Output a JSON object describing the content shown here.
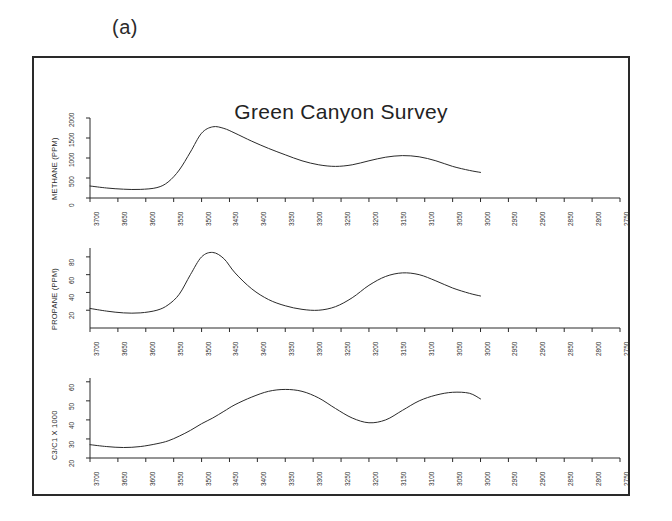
{
  "panel_label": "(a)",
  "chart_data": {
    "type": "line",
    "title": "Green Canyon Survey",
    "xlabel": "",
    "grid": false,
    "legend": "none",
    "x_axis": {
      "reversed": true,
      "range": [
        3700,
        2750
      ],
      "ticks": [
        3700,
        3650,
        3600,
        3550,
        3500,
        3450,
        3400,
        3350,
        3300,
        3250,
        3200,
        3150,
        3100,
        3050,
        3000,
        2950,
        2900,
        2850,
        2800,
        2750
      ],
      "tick_labels": [
        "3700",
        "3650",
        "3600",
        "3550",
        "3500",
        "3450",
        "3400",
        "3350",
        "3300",
        "3250",
        "3200",
        "3150",
        "3100",
        "3050",
        "3000",
        "2950",
        "2900",
        "2850",
        "2800",
        "2750"
      ]
    },
    "panels": [
      {
        "id": "methane",
        "ylabel": "METHANE (PPM)",
        "ylim": [
          0,
          2000
        ],
        "yticks": [
          0,
          500,
          1000,
          1500,
          2000
        ],
        "ytick_labels": [
          "0",
          "500",
          "1000",
          "1500",
          "2000"
        ],
        "data_x_range": [
          3700,
          3000
        ],
        "x": [
          3700,
          3670,
          3640,
          3610,
          3580,
          3560,
          3540,
          3520,
          3500,
          3480,
          3460,
          3440,
          3410,
          3380,
          3350,
          3320,
          3290,
          3260,
          3230,
          3200,
          3170,
          3140,
          3110,
          3080,
          3050,
          3020,
          3000
        ],
        "y": [
          300,
          250,
          220,
          215,
          260,
          400,
          700,
          1150,
          1620,
          1780,
          1740,
          1620,
          1420,
          1240,
          1080,
          930,
          830,
          790,
          830,
          930,
          1020,
          1060,
          1030,
          930,
          790,
          690,
          640
        ]
      },
      {
        "id": "propane",
        "ylabel": "PROPANE (PPM)",
        "ylim": [
          0,
          90
        ],
        "yticks": [
          20,
          40,
          60,
          80
        ],
        "ytick_labels": [
          "20",
          "40",
          "60",
          "80"
        ],
        "data_x_range": [
          3700,
          3000
        ],
        "x": [
          3700,
          3670,
          3640,
          3610,
          3580,
          3560,
          3540,
          3520,
          3500,
          3480,
          3460,
          3440,
          3410,
          3380,
          3350,
          3320,
          3290,
          3260,
          3230,
          3200,
          3170,
          3140,
          3110,
          3080,
          3050,
          3020,
          3000
        ],
        "y": [
          22,
          19,
          17,
          17,
          20,
          26,
          38,
          60,
          80,
          85,
          78,
          62,
          44,
          32,
          25,
          21,
          20,
          24,
          34,
          48,
          58,
          62,
          60,
          53,
          45,
          39,
          36
        ]
      },
      {
        "id": "ratio",
        "ylabel": "C3/C1 X 1000",
        "ylim": [
          20,
          62
        ],
        "yticks": [
          20,
          30,
          40,
          50,
          60
        ],
        "ytick_labels": [
          "20",
          "30",
          "40",
          "50",
          "60"
        ],
        "data_x_range": [
          3700,
          3000
        ],
        "x": [
          3700,
          3670,
          3640,
          3610,
          3580,
          3560,
          3540,
          3520,
          3500,
          3480,
          3460,
          3440,
          3410,
          3380,
          3350,
          3320,
          3290,
          3260,
          3230,
          3200,
          3170,
          3140,
          3110,
          3080,
          3050,
          3020,
          3000
        ],
        "y": [
          27,
          26,
          25.5,
          26,
          27.5,
          29,
          31.5,
          34.5,
          38,
          41,
          44.5,
          48,
          52,
          55,
          56,
          55,
          51.5,
          46,
          41,
          38.5,
          40,
          45,
          50,
          53,
          54.5,
          54,
          51
        ]
      }
    ]
  }
}
